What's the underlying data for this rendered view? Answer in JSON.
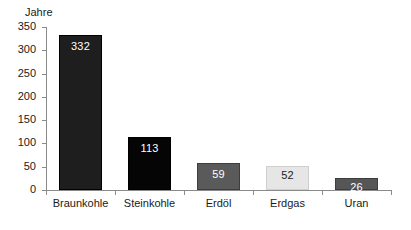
{
  "chart_data": {
    "type": "bar",
    "title": "",
    "subtitle": "",
    "xlabel": "",
    "ylabel": "Jahre",
    "ylim": [
      0,
      350
    ],
    "yticks": [
      0,
      50,
      100,
      150,
      200,
      250,
      300,
      350
    ],
    "ytick_labels": [
      "0",
      "50",
      "100",
      "150",
      "200",
      "250",
      "300",
      "350"
    ],
    "grid": false,
    "legend": false,
    "categories": [
      "Braunkohle",
      "Steinkohle",
      "Erdöl",
      "Erdgas",
      "Uran"
    ],
    "values": [
      332,
      113,
      59,
      52,
      26
    ],
    "value_labels": [
      "332",
      "113",
      "59",
      "52",
      "26"
    ],
    "bar_colors": [
      "#1e1e1e",
      "#050505",
      "#5a5a5a",
      "#e6e6e6",
      "#565656"
    ],
    "bar_label_colors": [
      "#ffffff",
      "#ffffff",
      "#ffffff",
      "#1a1a1a",
      "#ffffff"
    ],
    "bar_border_colors": [
      "#000000",
      "#000000",
      "#3d3d3d",
      "#cfcfcf",
      "#3d3d3d"
    ],
    "axis_color": "#8a8a8a",
    "background": "#ffffff"
  }
}
